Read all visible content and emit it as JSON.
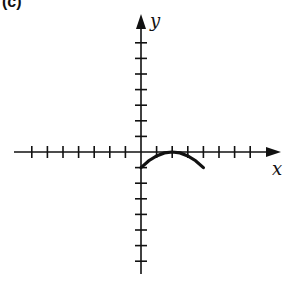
{
  "panel_label": "(c)",
  "chart_data": {
    "type": "line",
    "title": "",
    "xlabel": "x",
    "ylabel": "y",
    "xlim": [
      -8,
      8
    ],
    "ylim": [
      -8,
      9
    ],
    "grid": false,
    "tick_labels": false,
    "x_ticks": [
      -7,
      -6,
      -5,
      -4,
      -3,
      -2,
      -1,
      1,
      2,
      3,
      4,
      5,
      6,
      7
    ],
    "y_ticks": [
      -7,
      -6,
      -5,
      -4,
      -3,
      -2,
      -1,
      1,
      2,
      3,
      4,
      5,
      6,
      7
    ],
    "series": [
      {
        "name": "curve",
        "description": "Downward-opening arc from (0,-1) to vertex (2,0) to (4,-1)",
        "x": [
          0,
          0.5,
          1,
          1.5,
          2,
          2.5,
          3,
          3.5,
          4
        ],
        "y": [
          -1,
          -0.56,
          -0.25,
          -0.06,
          0,
          -0.06,
          -0.25,
          -0.56,
          -1
        ]
      }
    ]
  }
}
